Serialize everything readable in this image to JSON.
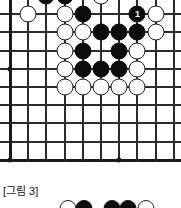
{
  "figure": {
    "caption": "[그림 3]",
    "type": "go-board-diagram",
    "colors": {
      "board_background": "#ffffff",
      "grid_line": "#2b2b2b",
      "black_stone": "#0d0d0d",
      "white_stone": "#ffffff",
      "stone_outline": "#1a1a1a",
      "move_number_text": "#ffffff"
    }
  },
  "board": {
    "origin_x": 10,
    "origin_y": -4,
    "spacing": 18.2,
    "cols": 10,
    "rows": 10,
    "star_points": [
      {
        "col": 0,
        "row": 4
      },
      {
        "col": 0,
        "row": 9
      },
      {
        "col": 6,
        "row": 9
      }
    ],
    "left_edge_col": 0,
    "bottom_edge_row": 9
  },
  "stones": [
    {
      "col": 2,
      "row": 0,
      "color": "black",
      "label": "",
      "clipped": true
    },
    {
      "col": 3,
      "row": 0,
      "color": "black",
      "label": "",
      "clipped": true
    },
    {
      "col": 5,
      "row": 0,
      "color": "white",
      "label": "",
      "clipped": true,
      "marked": true
    },
    {
      "col": 3,
      "row": 1,
      "color": "white",
      "label": ""
    },
    {
      "col": 4,
      "row": 1,
      "color": "black",
      "label": ""
    },
    {
      "col": 7,
      "row": 1,
      "color": "black",
      "label": "1"
    },
    {
      "col": 8,
      "row": 1,
      "color": "white",
      "label": ""
    },
    {
      "col": 3,
      "row": 2,
      "color": "white",
      "label": ""
    },
    {
      "col": 4,
      "row": 2,
      "color": "white",
      "label": ""
    },
    {
      "col": 5,
      "row": 2,
      "color": "black",
      "label": ""
    },
    {
      "col": 6,
      "row": 2,
      "color": "black",
      "label": ""
    },
    {
      "col": 7,
      "row": 2,
      "color": "black",
      "label": ""
    },
    {
      "col": 8,
      "row": 2,
      "color": "white",
      "label": ""
    },
    {
      "col": 3,
      "row": 3,
      "color": "white",
      "label": ""
    },
    {
      "col": 4,
      "row": 3,
      "color": "black",
      "label": ""
    },
    {
      "col": 6,
      "row": 3,
      "color": "black",
      "label": ""
    },
    {
      "col": 7,
      "row": 3,
      "color": "white",
      "label": ""
    },
    {
      "col": 3,
      "row": 4,
      "color": "white",
      "label": ""
    },
    {
      "col": 4,
      "row": 4,
      "color": "black",
      "label": ""
    },
    {
      "col": 5,
      "row": 4,
      "color": "black",
      "label": ""
    },
    {
      "col": 6,
      "row": 4,
      "color": "black",
      "label": ""
    },
    {
      "col": 7,
      "row": 4,
      "color": "white",
      "label": ""
    },
    {
      "col": 1,
      "row": 1,
      "color": "white",
      "label": ""
    },
    {
      "col": 3,
      "row": 5,
      "color": "white",
      "label": ""
    },
    {
      "col": 4,
      "row": 5,
      "color": "white",
      "label": ""
    },
    {
      "col": 5,
      "row": 5,
      "color": "white",
      "label": ""
    },
    {
      "col": 6,
      "row": 5,
      "color": "white",
      "label": ""
    },
    {
      "col": 7,
      "row": 5,
      "color": "white",
      "label": ""
    }
  ],
  "bottom_strip_stones": [
    {
      "x": 68,
      "color": "white"
    },
    {
      "x": 84,
      "color": "black"
    },
    {
      "x": 112,
      "color": "black"
    },
    {
      "x": 128,
      "color": "black"
    },
    {
      "x": 146,
      "color": "white"
    }
  ]
}
